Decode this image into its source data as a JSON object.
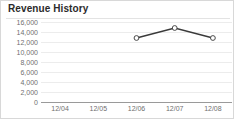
{
  "panel": {
    "title": "Revenue History"
  },
  "chart_data": {
    "type": "line",
    "title": "Revenue History",
    "xlabel": "",
    "ylabel": "",
    "categories": [
      "12/04",
      "12/05",
      "12/06",
      "12/07",
      "12/08"
    ],
    "series": [
      {
        "name": "Revenue",
        "values": [
          null,
          null,
          12800,
          14800,
          12800
        ]
      }
    ],
    "ylim": [
      0,
      16000
    ],
    "ytick_values": [
      16000,
      14000,
      12000,
      10000,
      8000,
      6000,
      4000,
      2000,
      0
    ],
    "ytick_labels": [
      "16,000",
      "14,000",
      "12,000",
      "10,000",
      "8,000",
      "6,000",
      "4,000",
      "2,000",
      "0"
    ],
    "grid": true,
    "legend": false,
    "marker": "open-circle",
    "line_color": "#3a3a3a",
    "grid_color": "#ececec",
    "axis_color": "#9a9a9a",
    "label_color": "#6f6f6f"
  }
}
